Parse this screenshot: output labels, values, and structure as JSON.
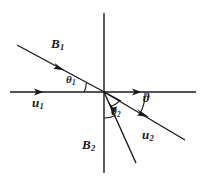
{
  "figure": {
    "background_color": "#ffffff",
    "stroke_color": "#1a1a1a",
    "axes": {
      "horizontal": {
        "name": "horizontal-axis",
        "x1": 10,
        "y1": 92,
        "x2": 196,
        "y2": 92,
        "arrow_left_at_x": 42,
        "arrow_right_at_x": 141
      },
      "vertical": {
        "name": "vertical-axis",
        "x1": 104,
        "y1": 13,
        "x2": 104,
        "y2": 173
      }
    },
    "rays": [
      {
        "id": "B1",
        "name": "b1-ray",
        "x1": 17,
        "y1": 45,
        "x2": 121,
        "y2": 101,
        "arrow_at": {
          "x": 63,
          "y": 70
        },
        "arrow_direction": "down-right"
      },
      {
        "id": "B2",
        "name": "b2-ray",
        "x1": 104,
        "y1": 92,
        "x2": 136,
        "y2": 163,
        "arrow_at": {
          "x": 114,
          "y": 115
        },
        "arrow_direction": "up-left"
      },
      {
        "id": "u2",
        "name": "u2-ray",
        "x1": 104,
        "y1": 92,
        "x2": 184,
        "y2": 139,
        "arrow_at": {
          "x": 146,
          "y": 117
        },
        "arrow_direction": "down-right"
      }
    ],
    "arcs": [
      {
        "id": "theta1",
        "name": "theta1-arc",
        "description": "angle between incoming B1 ray and the negative horizontal axis"
      },
      {
        "id": "theta2",
        "name": "theta2-arc",
        "description": "angle between the negative vertical axis and the B2 ray"
      },
      {
        "id": "vartheta",
        "name": "vartheta-arc",
        "description": "angle between the positive horizontal axis and the u2 ray"
      }
    ],
    "labels": [
      {
        "id": "B1",
        "name": "b1-label",
        "base": "B",
        "sub": "1",
        "symbol": "B₁"
      },
      {
        "id": "B2",
        "name": "b2-label",
        "base": "B",
        "sub": "2",
        "symbol": "B₂"
      },
      {
        "id": "u1",
        "name": "u1-label",
        "base": "u",
        "sub": "1",
        "symbol": "u₁"
      },
      {
        "id": "u2",
        "name": "u2-label",
        "base": "u",
        "sub": "2",
        "symbol": "u₂"
      },
      {
        "id": "theta1",
        "name": "theta1-label",
        "base": "θ",
        "sub": "1",
        "symbol": "θ₁"
      },
      {
        "id": "theta2",
        "name": "theta2-label",
        "base": "θ",
        "sub": "2",
        "symbol": "θ₂"
      },
      {
        "id": "vartheta",
        "name": "vartheta-label",
        "base": "ϑ",
        "sub": "",
        "symbol": "ϑ"
      }
    ]
  }
}
